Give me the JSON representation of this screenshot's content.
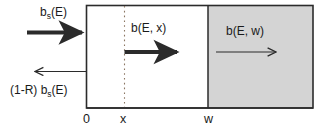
{
  "figure": {
    "colors": {
      "stroke": "#2b2b2b",
      "shaded_region_fill": "#d4d4d4",
      "background": "#ffffff",
      "dotted_line": "#7a6a5a"
    },
    "labels": {
      "incoming_flux": "b",
      "incoming_flux_sub": "s",
      "incoming_flux_tail": "(E)",
      "reflected_flux_prefix": "(1-R) b",
      "reflected_flux_sub": "s",
      "reflected_flux_tail": "(E)",
      "interior_flux": "b(E, x)",
      "exit_flux": "b(E, w)"
    },
    "axis": {
      "tick_origin": "0",
      "tick_x": "x",
      "tick_w": "w"
    }
  }
}
